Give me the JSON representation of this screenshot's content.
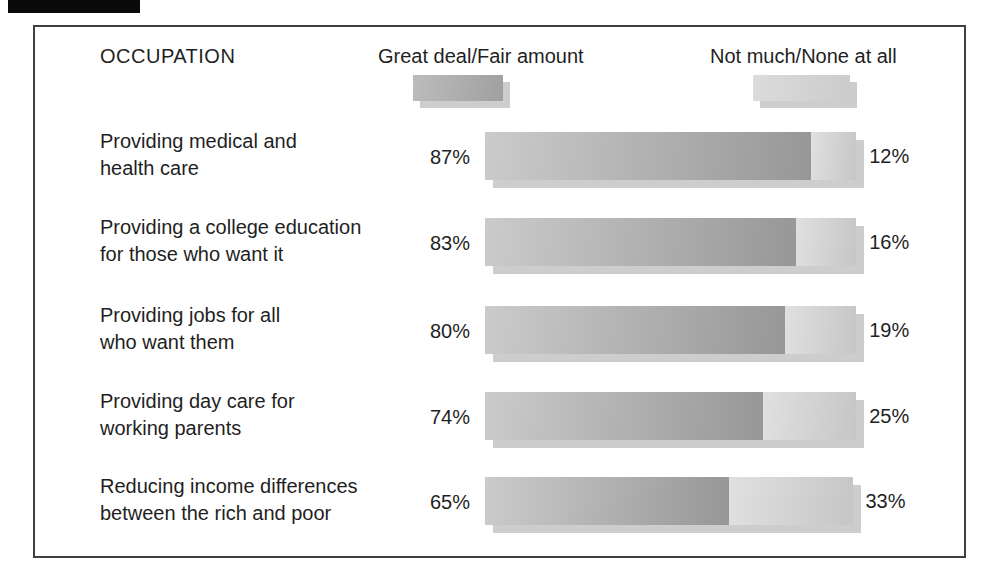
{
  "colors": {
    "page_bg": "#ffffff",
    "border": "#3f3f3f",
    "text": "#1f1f1f",
    "artifact": "#0a0a0a",
    "bar_dark_start": "#cbcbcb",
    "bar_dark_end": "#979797",
    "bar_light_start": "#e0e0e0",
    "bar_light_end": "#c6c6c6",
    "shadow": "#cdcdcd"
  },
  "header": {
    "title": "OCCUPATION",
    "legend": [
      {
        "label": "Great deal/Fair amount"
      },
      {
        "label": "Not much/None at all"
      }
    ]
  },
  "rows": [
    {
      "lines": [
        "Providing medical and",
        "health care"
      ],
      "left_pct": "87%",
      "right_pct": "12%"
    },
    {
      "lines": [
        "Providing a college education",
        "for those who want it"
      ],
      "left_pct": "83%",
      "right_pct": "16%"
    },
    {
      "lines": [
        "Providing jobs for all",
        "who want them"
      ],
      "left_pct": "80%",
      "right_pct": "19%"
    },
    {
      "lines": [
        "Providing day care for",
        "working parents"
      ],
      "left_pct": "74%",
      "right_pct": "25%"
    },
    {
      "lines": [
        "Reducing income differences",
        "between the rich and poor"
      ],
      "left_pct": "65%",
      "right_pct": "33%"
    }
  ],
  "chart_data": {
    "type": "bar",
    "orientation": "horizontal",
    "title": "OCCUPATION",
    "unit": "%",
    "xlim": [
      0,
      100
    ],
    "grid": false,
    "legend_position": "top",
    "categories": [
      "Providing medical and health care",
      "Providing a college education for those who want it",
      "Providing jobs for all who want them",
      "Providing day care for working parents",
      "Reducing income differences between the rich and poor"
    ],
    "series": [
      {
        "name": "Great deal/Fair amount",
        "values": [
          87,
          83,
          80,
          74,
          65
        ]
      },
      {
        "name": "Not much/None at all",
        "values": [
          12,
          16,
          19,
          25,
          33
        ]
      }
    ]
  }
}
